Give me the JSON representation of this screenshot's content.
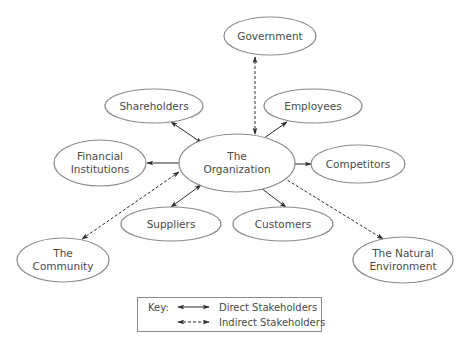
{
  "diagram": {
    "center": {
      "id": "org",
      "line1": "The",
      "line2": "Organization"
    },
    "nodes": {
      "government": {
        "line1": "Government"
      },
      "shareholders": {
        "line1": "Shareholders"
      },
      "employees": {
        "line1": "Employees"
      },
      "financial": {
        "line1": "Financial",
        "line2": "Institutions"
      },
      "competitors": {
        "line1": "Competitors"
      },
      "suppliers": {
        "line1": "Suppliers"
      },
      "customers": {
        "line1": "Customers"
      },
      "community": {
        "line1": "The",
        "line2": "Community"
      },
      "environment": {
        "line1": "The Natural",
        "line2": "Environment"
      }
    },
    "edges": [
      {
        "from": "org",
        "to": "government",
        "type": "indirect"
      },
      {
        "from": "org",
        "to": "shareholders",
        "type": "direct"
      },
      {
        "from": "org",
        "to": "employees",
        "type": "direct"
      },
      {
        "from": "org",
        "to": "financial",
        "type": "direct"
      },
      {
        "from": "org",
        "to": "competitors",
        "type": "direct"
      },
      {
        "from": "org",
        "to": "suppliers",
        "type": "direct"
      },
      {
        "from": "org",
        "to": "customers",
        "type": "direct"
      },
      {
        "from": "org",
        "to": "community",
        "type": "indirect"
      },
      {
        "from": "org",
        "to": "environment",
        "type": "indirect"
      }
    ],
    "key": {
      "title": "Key:",
      "direct_label": "Direct Stakeholders",
      "indirect_label": "Indirect Stakeholders"
    },
    "colors": {
      "ellipse_stroke": "#8a8a8a",
      "text": "#4a4a4a",
      "arrow": "#2b2b2b"
    }
  }
}
